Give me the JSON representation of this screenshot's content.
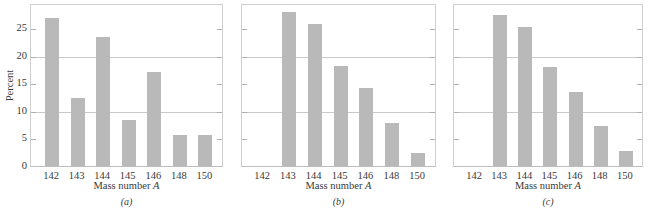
{
  "chart_data": [
    {
      "type": "bar",
      "panel": "(a)",
      "categories": [
        "142",
        "143",
        "144",
        "145",
        "146",
        "148",
        "150"
      ],
      "values": [
        26.8,
        12.3,
        23.5,
        8.4,
        17.0,
        5.7,
        5.7
      ],
      "xlabel": "Mass number A",
      "ylabel": "Percent",
      "yticks": [
        0,
        5,
        10,
        15,
        20,
        25
      ],
      "ylim": [
        0,
        29.6
      ],
      "gridlines_y": [
        10,
        20
      ],
      "caption": "(a)"
    },
    {
      "type": "bar",
      "panel": "(b)",
      "categories": [
        "142",
        "143",
        "144",
        "145",
        "146",
        "148",
        "150"
      ],
      "values": [
        0,
        27.9,
        25.8,
        18.2,
        14.1,
        7.8,
        2.4
      ],
      "xlabel": "Mass number A",
      "ylabel": "Percent",
      "yticks": [
        0,
        5,
        10,
        15,
        20,
        25
      ],
      "ylim": [
        0,
        29.6
      ],
      "gridlines_y": [
        10,
        20
      ],
      "caption": "(b)"
    },
    {
      "type": "bar",
      "panel": "(c)",
      "categories": [
        "142",
        "143",
        "144",
        "145",
        "146",
        "148",
        "150"
      ],
      "values": [
        0,
        27.5,
        25.2,
        17.9,
        13.5,
        7.2,
        2.8
      ],
      "xlabel": "Mass number A",
      "ylabel": "Percent",
      "yticks": [
        0,
        5,
        10,
        15,
        20,
        25
      ],
      "ylim": [
        0,
        29.6
      ],
      "gridlines_y": [
        10,
        20
      ],
      "caption": "(c)"
    }
  ],
  "labels": {
    "ylabel": "Percent",
    "xlabel_text": "Mass number ",
    "xlabel_var": "A",
    "yticks": [
      "0",
      "5",
      "10",
      "15",
      "20",
      "25"
    ],
    "captions": [
      "(a)",
      "(b)",
      "(c)"
    ]
  },
  "colors": {
    "bar": "#b9b9b9",
    "grid": "#c8c8c8",
    "frame": "#cfcfcf"
  }
}
